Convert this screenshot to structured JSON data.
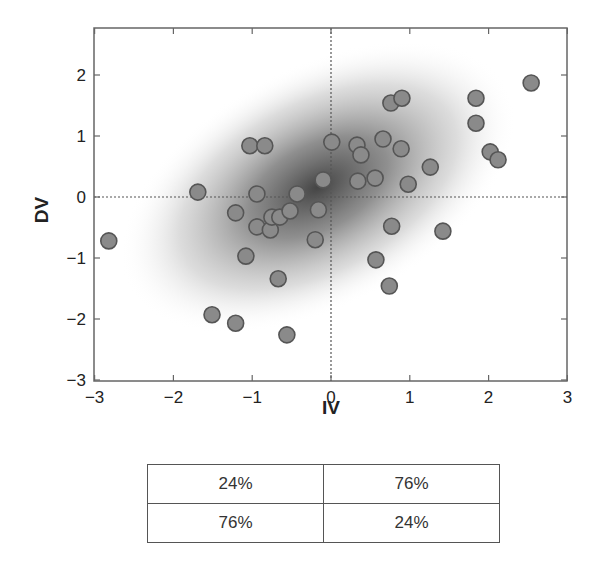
{
  "chart_data": {
    "type": "scatter",
    "title": "",
    "xlabel": "IV",
    "ylabel": "DV",
    "xlim": [
      -3,
      3
    ],
    "ylim": [
      -3,
      2.7
    ],
    "xticks": [
      -3,
      -2,
      -1,
      0,
      1,
      2,
      3
    ],
    "yticks": [
      -3,
      -2,
      -1,
      0,
      1,
      2
    ],
    "xtick_labels": [
      "−3",
      "−2",
      "−1",
      "0",
      "1",
      "2",
      "3"
    ],
    "ytick_labels": [
      "−3",
      "−2",
      "−1",
      "0",
      "1",
      "2"
    ],
    "grid": false,
    "reference_lines": {
      "x": 0,
      "y": 0,
      "style": "dotted"
    },
    "background": "bivariate normal density shading (positive correlation), darkest near origin",
    "point_color": "#8a8a8a",
    "point_edge_color": "#555555",
    "points": [
      {
        "x": -2.82,
        "y": -0.72
      },
      {
        "x": -1.69,
        "y": 0.08
      },
      {
        "x": -1.51,
        "y": -1.93
      },
      {
        "x": -1.21,
        "y": -2.07
      },
      {
        "x": -1.21,
        "y": -0.26
      },
      {
        "x": -1.03,
        "y": 0.84
      },
      {
        "x": -0.84,
        "y": 0.84
      },
      {
        "x": -0.94,
        "y": 0.05
      },
      {
        "x": -0.94,
        "y": -0.49
      },
      {
        "x": -1.08,
        "y": -0.97
      },
      {
        "x": -0.77,
        "y": -0.54
      },
      {
        "x": -0.75,
        "y": -0.33
      },
      {
        "x": -0.65,
        "y": -0.33
      },
      {
        "x": -0.52,
        "y": -0.23
      },
      {
        "x": -0.43,
        "y": 0.05
      },
      {
        "x": -0.67,
        "y": -1.34
      },
      {
        "x": -0.56,
        "y": -2.26
      },
      {
        "x": -0.2,
        "y": -0.7
      },
      {
        "x": -0.16,
        "y": -0.21
      },
      {
        "x": -0.1,
        "y": 0.28
      },
      {
        "x": 0.01,
        "y": 0.9
      },
      {
        "x": 0.33,
        "y": 0.85
      },
      {
        "x": 0.38,
        "y": 0.69
      },
      {
        "x": 0.34,
        "y": 0.26
      },
      {
        "x": 0.56,
        "y": 0.31
      },
      {
        "x": 0.66,
        "y": 0.95
      },
      {
        "x": 0.89,
        "y": 0.79
      },
      {
        "x": 0.98,
        "y": 0.21
      },
      {
        "x": 1.26,
        "y": 0.49
      },
      {
        "x": 0.77,
        "y": -0.48
      },
      {
        "x": 0.57,
        "y": -1.03
      },
      {
        "x": 0.74,
        "y": -1.46
      },
      {
        "x": 1.42,
        "y": -0.56
      },
      {
        "x": 0.76,
        "y": 1.54
      },
      {
        "x": 0.9,
        "y": 1.62
      },
      {
        "x": 1.84,
        "y": 1.62
      },
      {
        "x": 1.84,
        "y": 1.21
      },
      {
        "x": 2.02,
        "y": 0.74
      },
      {
        "x": 2.12,
        "y": 0.61
      },
      {
        "x": 2.54,
        "y": 1.87
      }
    ],
    "quadrant_table": {
      "rows": [
        [
          "24%",
          "76%"
        ],
        [
          "76%",
          "24%"
        ]
      ]
    }
  },
  "table": {
    "r0c0": "24%",
    "r0c1": "76%",
    "r1c0": "76%",
    "r1c1": "24%"
  }
}
